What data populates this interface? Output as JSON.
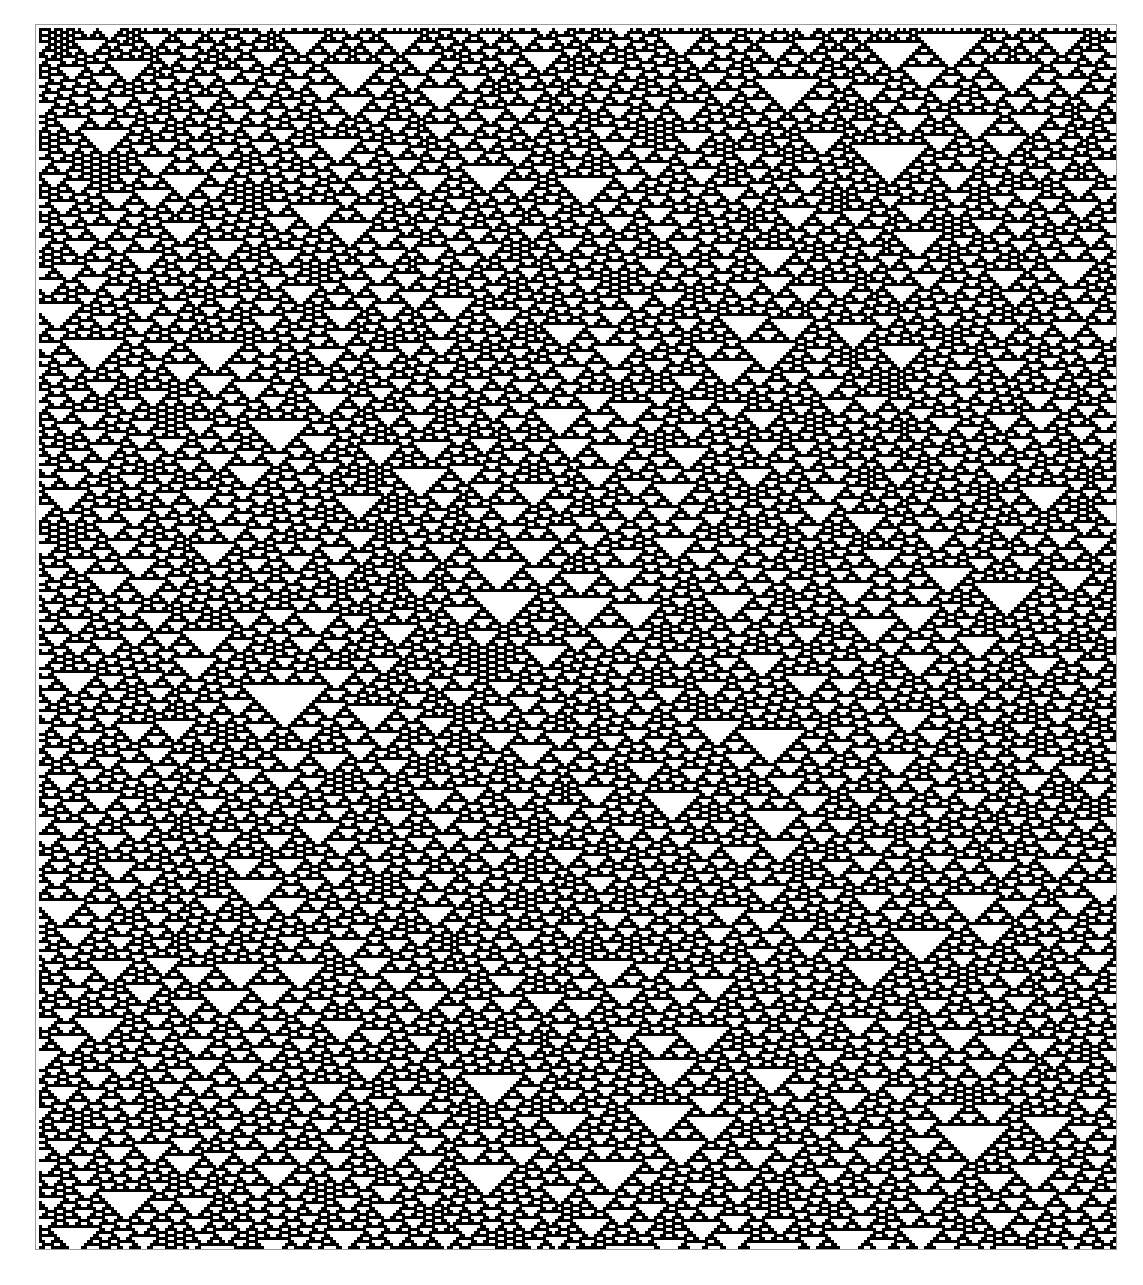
{
  "figure": {
    "caption": ""
  },
  "automaton": {
    "rule": 126,
    "columns": 359,
    "rows": 407,
    "cell_size_px": 3,
    "seed": 30,
    "initial_density": 0.5,
    "boundary": "periodic"
  },
  "colors": {
    "on": "#000000",
    "off": "#ffffff",
    "frame_border": "#9a9a9a",
    "background": "#ffffff"
  }
}
